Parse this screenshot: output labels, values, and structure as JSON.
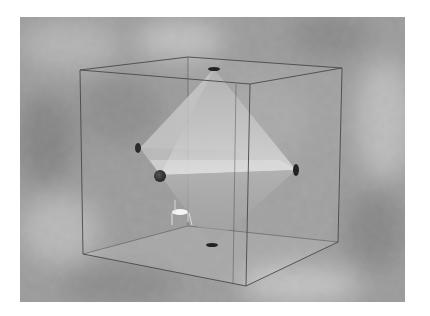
{
  "figure": {
    "colors": {
      "page_background": "#ffffff",
      "cloud_base": "#9a9a9a",
      "cloud_light": "#c4c4c4",
      "cloud_dark": "#7e7e7e",
      "cube_edge": "#4a4a4a",
      "octahedron_face_light": "#d6d6d6",
      "octahedron_face_mid": "#b8b8b8",
      "marker": "#2a2a2a",
      "chair": "#f2f2f2"
    },
    "cube": {
      "front": {
        "tl": [
          80,
          70
        ],
        "tr": [
          250,
          84
        ],
        "br": [
          246,
          286
        ],
        "bl": [
          83,
          254
        ]
      },
      "back": {
        "tl": [
          188,
          57
        ],
        "tr": [
          342,
          68
        ],
        "br": [
          338,
          242
        ],
        "bl": [
          188,
          226
        ]
      }
    },
    "octahedron": {
      "top": [
        214,
        69
      ],
      "left_back": [
        140,
        148
      ],
      "left_front": [
        160,
        175
      ],
      "right": [
        296,
        170
      ],
      "back": [
        230,
        150
      ],
      "bottom": [
        212,
        245
      ]
    },
    "markers": [
      {
        "name": "top-marker",
        "cx": 214,
        "cy": 69,
        "rx": 6,
        "ry": 2
      },
      {
        "name": "left-back-marker",
        "cx": 138,
        "cy": 148,
        "rx": 3,
        "ry": 5
      },
      {
        "name": "left-front-marker",
        "cx": 160,
        "cy": 176,
        "rx": 6,
        "ry": 6
      },
      {
        "name": "right-marker",
        "cx": 296,
        "cy": 170,
        "rx": 3,
        "ry": 6
      },
      {
        "name": "bottom-marker",
        "cx": 212,
        "cy": 245,
        "rx": 6,
        "ry": 2
      }
    ],
    "chair": {
      "x": 172,
      "y": 207
    }
  }
}
